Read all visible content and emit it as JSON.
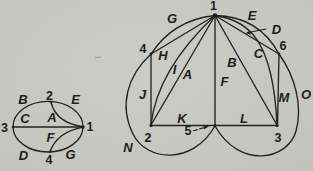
{
  "figure_type": "planar-multigraph-diagrams",
  "left_graph": {
    "description": "Ellipse graph with 4 vertices and 7 labeled edges",
    "vertices": {
      "v1": "1",
      "v2": "2",
      "v3": "3",
      "v4": "4"
    },
    "edge_labels": {
      "A": "A",
      "B": "B",
      "C": "C",
      "D": "D",
      "E": "E",
      "F": "F",
      "G": "G"
    },
    "structure": [
      {
        "edge": "A",
        "from": "2",
        "to": "1",
        "style": "inner curve"
      },
      {
        "edge": "B",
        "from": "3",
        "to": "2",
        "style": "ellipse arc top-left"
      },
      {
        "edge": "C",
        "from": "3",
        "to": "1",
        "style": "straight horizontal"
      },
      {
        "edge": "D",
        "from": "3",
        "to": "4",
        "style": "ellipse arc bottom-left"
      },
      {
        "edge": "E",
        "from": "2",
        "to": "1",
        "style": "ellipse arc top-right"
      },
      {
        "edge": "F",
        "from": "4",
        "to": "1",
        "style": "inner curve"
      },
      {
        "edge": "G",
        "from": "4",
        "to": "1",
        "style": "ellipse arc bottom-right"
      }
    ]
  },
  "right_graph": {
    "description": "Graph with 6 vertices and 15 labeled edges, outer loops to vertex 5",
    "vertices": {
      "v1": "1",
      "v2": "2",
      "v3": "3",
      "v4": "4",
      "v5": "5",
      "v6": "6"
    },
    "edge_labels": {
      "A": "A",
      "B": "B",
      "C": "C",
      "D": "D",
      "E": "E",
      "F": "F",
      "G": "G",
      "H": "H",
      "I": "I",
      "J": "J",
      "K": "K",
      "L": "L",
      "M": "M",
      "N": "N",
      "O": "O"
    },
    "structure": [
      {
        "edge": "A",
        "from": "1",
        "to": "2",
        "style": "straight"
      },
      {
        "edge": "B",
        "from": "1",
        "to": "3",
        "style": "straight"
      },
      {
        "edge": "C",
        "from": "1",
        "to": "3",
        "style": "curve passing near 6"
      },
      {
        "edge": "D",
        "from": "1",
        "to": "6",
        "style": "straight, marked by arrow"
      },
      {
        "edge": "E",
        "from": "1",
        "to": "6",
        "style": "outer arc"
      },
      {
        "edge": "F",
        "from": "1",
        "to": "5",
        "style": "vertical"
      },
      {
        "edge": "G",
        "from": "1",
        "to": "4",
        "style": "outer arc"
      },
      {
        "edge": "H",
        "from": "1",
        "to": "4",
        "style": "straight"
      },
      {
        "edge": "I",
        "from": "1",
        "to": "2",
        "style": "curved"
      },
      {
        "edge": "J",
        "from": "4",
        "to": "2",
        "style": "vertical"
      },
      {
        "edge": "K",
        "from": "2",
        "to": "5",
        "style": "horizontal"
      },
      {
        "edge": "L",
        "from": "5",
        "to": "3",
        "style": "horizontal"
      },
      {
        "edge": "M",
        "from": "6",
        "to": "3",
        "style": "vertical"
      },
      {
        "edge": "N",
        "from": "4",
        "to": "5",
        "style": "outer loop around 2"
      },
      {
        "edge": "O",
        "from": "6",
        "to": "5",
        "style": "outer loop around 3"
      }
    ],
    "callouts": [
      {
        "label": "D",
        "points_to": "edge D"
      },
      {
        "label": "5",
        "points_to": "vertex 5"
      }
    ]
  }
}
